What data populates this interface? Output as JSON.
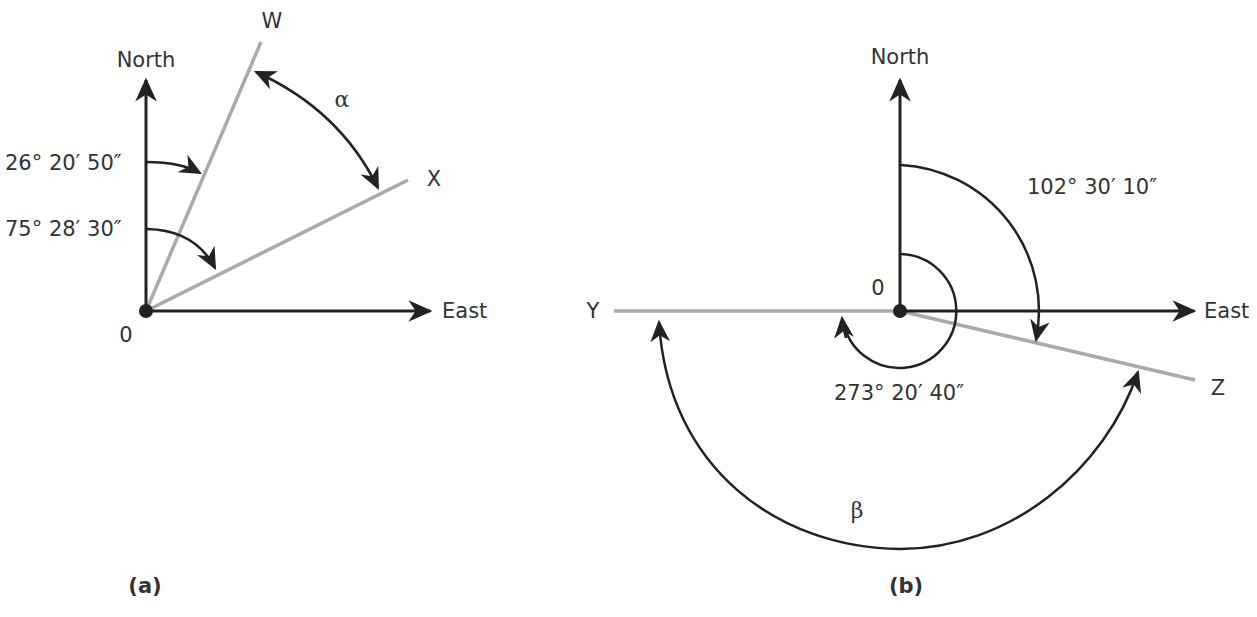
{
  "figure_a": {
    "caption": "(a)",
    "north_label": "North",
    "east_label": "East",
    "origin_label": "0",
    "line_w_label": "W",
    "line_x_label": "X",
    "angle_w_label": "26° 20′ 50″",
    "angle_x_label": "75° 28′ 30″",
    "alpha_label": "α"
  },
  "figure_b": {
    "caption": "(b)",
    "north_label": "North",
    "east_label": "East",
    "origin_label": "0",
    "line_y_label": "Y",
    "line_z_label": "Z",
    "angle_z_label": "102° 30′ 10″",
    "angle_y_label": "273° 20′ 40″",
    "beta_label": "β"
  },
  "colors": {
    "axis": "#222222",
    "bearing_line": "#aaaaaa",
    "text": "#333333"
  }
}
